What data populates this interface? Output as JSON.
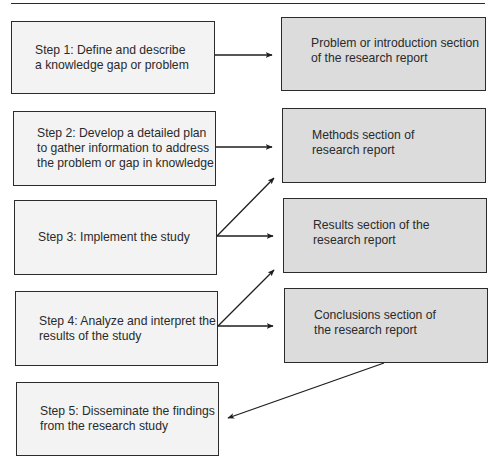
{
  "diagram": {
    "type": "flowchart",
    "steps": [
      {
        "id": "step1",
        "label": "Step 1: Define and describe\na knowledge gap or problem"
      },
      {
        "id": "step2",
        "label": "Step 2: Develop a detailed plan\nto gather information to address\nthe problem or gap in knowledge"
      },
      {
        "id": "step3",
        "label": "Step 3: Implement the study"
      },
      {
        "id": "step4",
        "label": "Step 4: Analyze and interpret the\nresults of the study"
      },
      {
        "id": "step5",
        "label": "Step 5: Disseminate the findings\nfrom the research study"
      }
    ],
    "sections": [
      {
        "id": "intro",
        "label": "Problem or introduction section\nof the research report"
      },
      {
        "id": "methods",
        "label": "Methods section of\nresearch report"
      },
      {
        "id": "results",
        "label": "Results section of the\nresearch report"
      },
      {
        "id": "conclusions",
        "label": "Conclusions section of\nthe research report"
      }
    ],
    "connections": [
      {
        "from": "step1",
        "to": "intro"
      },
      {
        "from": "step2",
        "to": "methods"
      },
      {
        "from": "step3",
        "to": "methods"
      },
      {
        "from": "step3",
        "to": "results"
      },
      {
        "from": "step4",
        "to": "results"
      },
      {
        "from": "step4",
        "to": "conclusions"
      },
      {
        "from": "conclusions",
        "to": "step5"
      }
    ],
    "colors": {
      "step_fill": "#f3f3f3",
      "section_fill": "#dcdcdc",
      "stroke": "#2b2b2b"
    }
  }
}
